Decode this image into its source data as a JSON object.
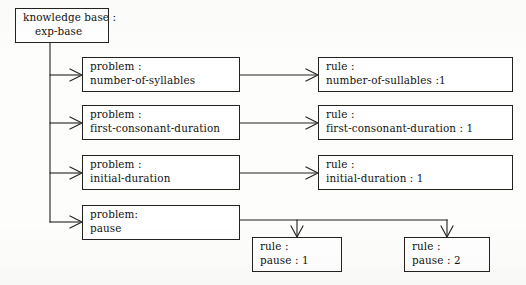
{
  "diagram": {
    "background_color": "#fdfdfc",
    "line_color": "#23221f",
    "text_color": "#121212",
    "nodes": [
      {
        "id": "root",
        "line1": "knowledge base :",
        "line2": "exp-base"
      },
      {
        "id": "problem-number-of-syllables",
        "line1": "problem :",
        "line2": "number-of-syllables"
      },
      {
        "id": "problem-first-consonant-duration",
        "line1": "problem :",
        "line2": "first-consonant-duration"
      },
      {
        "id": "problem-initial-duration",
        "line1": "problem :",
        "line2": "initial-duration"
      },
      {
        "id": "problem-pause",
        "line1": "problem:",
        "line2": "pause"
      },
      {
        "id": "rule-number-of-sullables",
        "line1": "rule :",
        "line2": "number-of-sullables :1"
      },
      {
        "id": "rule-first-consonant-duration",
        "line1": "rule :",
        "line2": "first-consonant-duration : 1"
      },
      {
        "id": "rule-initial-duration",
        "line1": "rule :",
        "line2": "initial-duration : 1"
      },
      {
        "id": "rule-pause-1",
        "line1": "rule :",
        "line2": "pause : 1"
      },
      {
        "id": "rule-pause-2",
        "line1": "rule :",
        "line2": "pause : 2"
      }
    ]
  }
}
